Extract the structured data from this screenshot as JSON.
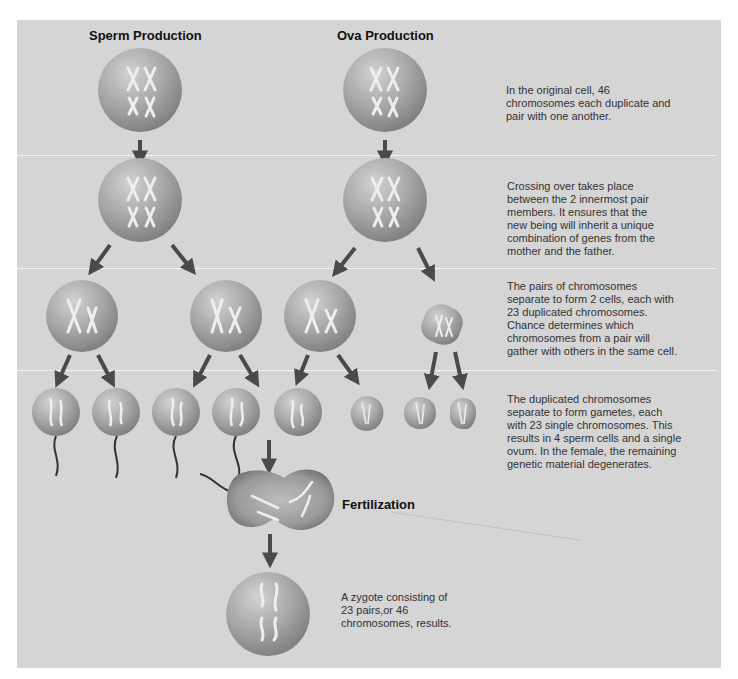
{
  "headings": {
    "sperm": "Sperm Production",
    "ova": "Ova Production",
    "fertilization": "Fertilization"
  },
  "steps": [
    {
      "text": "In the original cell, 46 chromosomes each duplicate and pair with one another."
    },
    {
      "text": "Crossing over takes place between the 2 innermost pair members. It ensures that the new being will inherit a unique combination of genes from the mother and the father."
    },
    {
      "text": "The pairs of chromosomes separate to form 2 cells, each with 23 duplicated chromosomes. Chance determines which chromosomes from a pair will gather with others in the same cell."
    },
    {
      "text": "The duplicated chromosomes separate to form gametes, each with 23 single chromosomes. This results in 4 sperm cells and a single ovum. In the female, the remaining genetic material degenerates."
    }
  ],
  "zygote": {
    "text": "A zygote consisting of 23 pairs,or 46 chromosomes, results."
  },
  "colors": {
    "panel": "#d5d5d5",
    "cell": "#a9a9a9",
    "arrow": "#4a4a4a",
    "divider": "#f2f2f2"
  }
}
